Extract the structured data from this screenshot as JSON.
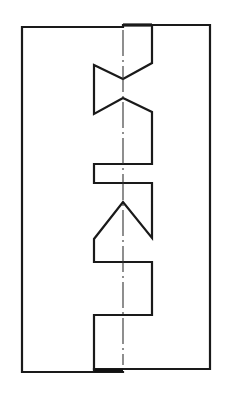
{
  "diagram": {
    "type": "engineering-drawing",
    "colors": {
      "background": "#ffffff",
      "line": "#1a1a1a",
      "centerline": "#333333"
    },
    "left_plate": {
      "outer_left_x": 22,
      "top_y": 27,
      "bottom_y": 372,
      "bottom_right_x": 123
    },
    "right_plate": {
      "outer_right_x": 210,
      "top_y": 25,
      "top_left_x": 123,
      "bottom_y": 369,
      "bottom_left_x": 94
    },
    "seam_profile": {
      "points": [
        [
          123,
          25
        ],
        [
          152,
          25
        ],
        [
          152,
          63
        ],
        [
          123,
          79
        ],
        [
          94,
          65
        ],
        [
          94,
          114
        ],
        [
          123,
          98
        ],
        [
          152,
          112
        ],
        [
          152,
          164
        ],
        [
          94,
          164
        ],
        [
          94,
          183
        ],
        [
          152,
          183
        ],
        [
          152,
          238
        ],
        [
          123,
          202
        ],
        [
          94,
          239
        ],
        [
          94,
          262
        ],
        [
          152,
          262
        ],
        [
          152,
          315
        ],
        [
          94,
          315
        ],
        [
          94,
          370
        ]
      ]
    },
    "centerline": {
      "x": 123,
      "y_start": 30,
      "y_end": 365,
      "style": "dash-dot"
    }
  }
}
